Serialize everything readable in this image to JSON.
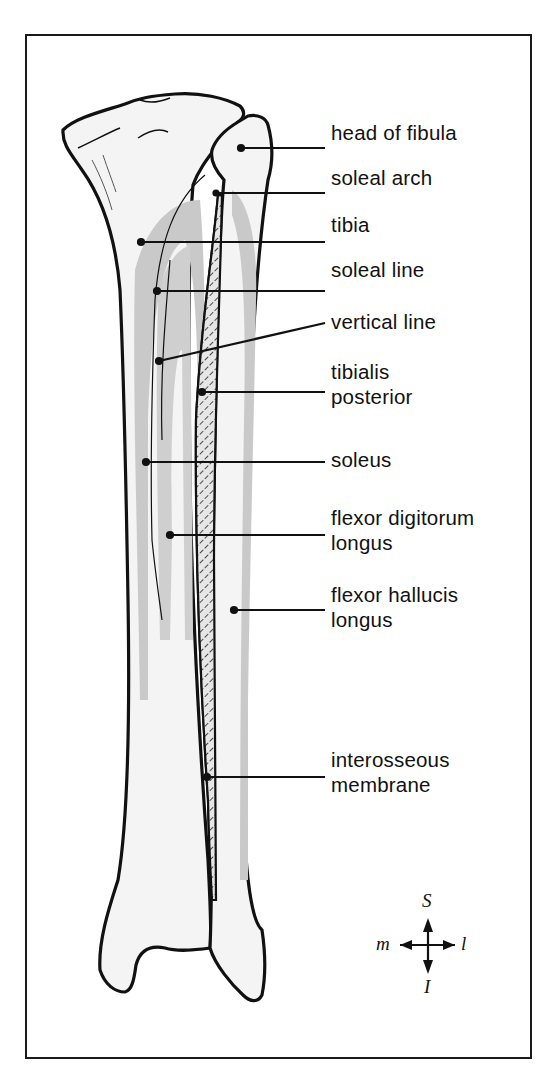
{
  "figure": {
    "type": "anatomical illustration",
    "colors": {
      "outline": "#111111",
      "bone_fill": "#f4f4f4",
      "muscle_shading": "#c9c9c9",
      "frame": "#1a1a1a"
    }
  },
  "labels": [
    {
      "id": "head-of-fibula",
      "lines": [
        "head of fibula"
      ]
    },
    {
      "id": "soleal-arch",
      "lines": [
        "soleal arch"
      ]
    },
    {
      "id": "tibia",
      "lines": [
        "tibia"
      ]
    },
    {
      "id": "soleal-line",
      "lines": [
        "soleal line"
      ]
    },
    {
      "id": "vertical-line",
      "lines": [
        "vertical line"
      ]
    },
    {
      "id": "tibialis-posterior",
      "lines": [
        "tibialis",
        "posterior"
      ]
    },
    {
      "id": "soleus",
      "lines": [
        "soleus"
      ]
    },
    {
      "id": "flexor-digitorum-longus",
      "lines": [
        "flexor digitorum",
        "longus"
      ]
    },
    {
      "id": "flexor-hallucis-longus",
      "lines": [
        "flexor hallucis",
        "longus"
      ]
    },
    {
      "id": "interosseous-membrane",
      "lines": [
        "interosseous",
        "membrane"
      ]
    }
  ],
  "compass": {
    "superior": "S",
    "inferior": "I",
    "medial": "m",
    "lateral": "l"
  }
}
